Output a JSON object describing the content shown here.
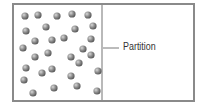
{
  "diagram": {
    "container": {
      "x": 13,
      "y": 4,
      "width": 181,
      "height": 97,
      "border_color": "#8a8a8a"
    },
    "partition": {
      "x": 102,
      "label": "Partition",
      "leader_from_x": 103,
      "leader_to_x": 119,
      "leader_y": 48
    },
    "particles": {
      "color": "#7a7a7a",
      "radius": 3.6,
      "count": 32,
      "positions": [
        [
          25,
          16
        ],
        [
          38,
          15
        ],
        [
          57,
          16
        ],
        [
          72,
          14
        ],
        [
          88,
          15
        ],
        [
          26,
          31
        ],
        [
          46,
          27
        ],
        [
          75,
          29
        ],
        [
          93,
          26
        ],
        [
          35,
          41
        ],
        [
          52,
          40
        ],
        [
          64,
          38
        ],
        [
          91,
          39
        ],
        [
          23,
          48
        ],
        [
          83,
          49
        ],
        [
          35,
          57
        ],
        [
          48,
          53
        ],
        [
          71,
          57
        ],
        [
          91,
          55
        ],
        [
          79,
          63
        ],
        [
          26,
          68
        ],
        [
          42,
          73
        ],
        [
          52,
          69
        ],
        [
          98,
          71
        ],
        [
          24,
          80
        ],
        [
          71,
          76
        ],
        [
          33,
          93
        ],
        [
          54,
          88
        ],
        [
          77,
          86
        ],
        [
          97,
          91
        ]
      ]
    }
  }
}
